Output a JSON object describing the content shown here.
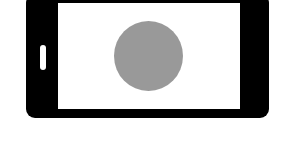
{
  "illustration": {
    "subject": "smartphone-landscape",
    "orientation": "landscape",
    "colors": {
      "background": "#ffffff",
      "body": "#000000",
      "screen": "#ffffff",
      "home_button": "#ffffff",
      "circle": "#999999"
    },
    "icons": {
      "phone": "smartphone-icon",
      "home_button": "home-button-icon",
      "circle": "circle-shape"
    }
  }
}
